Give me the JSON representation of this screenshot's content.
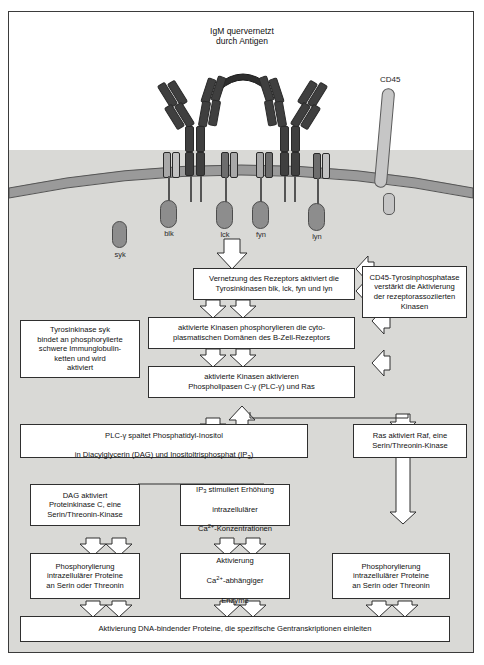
{
  "figure": {
    "title_label": "IgM quervernetzt\ndurch Antigen",
    "cd45_label": "CD45",
    "syk_label": "syk",
    "kinase_labels": [
      "blk",
      "lck",
      "fyn",
      "lyn"
    ],
    "colors": {
      "cytoplasm": "#d9d9d6",
      "membrane": "#9a9a9a",
      "antibody_dark": "#3f3f3f",
      "antibody_mid": "#6d6d6d",
      "antibody_light": "#a8a8a8",
      "kinase": "#8d8d8d",
      "cd45": "#c6c6c6",
      "box_fill": "#ffffff",
      "box_border": "#2f2f2f"
    }
  },
  "flow": {
    "b1": "Vernetzung des Rezeptors aktiviert die\nTyrosinkinasen blk, lck, fyn und lyn",
    "b2": "CD45-Tyrosinphosphatase\nverstärkt die Aktivierung\nder rezeptorassoziierten\nKinasen",
    "b3": "Tyrosinkinase syk\nbindet an phosphorylierte\nschwere Immunglobulin-\nketten und wird\naktiviert",
    "b4": "aktivierte Kinasen phosphorylieren die cyto-\nplasmatischen Domänen des B-Zell-Rezeptors",
    "b5": "aktivierte Kinasen aktivieren\nPhospholipasen C-γ (PLC-γ) und Ras",
    "b6_line1": "PLC-γ spaltet Phosphatidyl-Inositol",
    "b6_line2_a": "in Diacylglycerin (DAG) und Inositoltrisphosphat (IP",
    "b6_line2_sub": "3",
    "b6_line2_b": ")",
    "b7": "Ras aktiviert Raf, eine\nSerin/Threonin-Kinase",
    "b8": "DAG aktiviert\nProteinkinase C, eine\nSerin/Threonin-Kinase",
    "b9_line1_a": "IP",
    "b9_line1_sub": "3",
    "b9_line1_b": " stimuliert Erhöhung",
    "b9_line2": "intrazellulärer",
    "b9_line3_a": "Ca",
    "b9_line3_sup": "2+",
    "b9_line3_b": "-Konzentrationen",
    "b10": "Phosphorylierung\nintrazellulärer Proteine\nan Serin oder Threonin",
    "b11_line1": "Aktivierung",
    "b11_line2_a": "Ca",
    "b11_line2_sup": "2+",
    "b11_line2_b": "-abhängiger",
    "b11_line3": "Enzyme",
    "b12": "Phosphorylierung\nintrazellulärer Proteine\nan Serin oder Threonin",
    "b13": "Aktivierung DNA-bindender Proteine, die spezifische Gentranskriptionen einleiten"
  }
}
